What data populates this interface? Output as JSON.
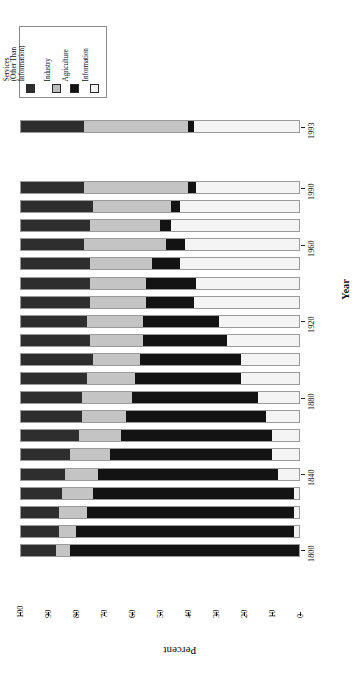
{
  "chart_data": {
    "type": "bar",
    "orientation": "horizontal-rotated-90",
    "stacked": true,
    "title": "",
    "xlabel": "Percent",
    "ylabel": "Year",
    "xlim": [
      0,
      100
    ],
    "x_tick_labels": [
      "100",
      "90",
      "80",
      "70",
      "60",
      "50",
      "40",
      "30",
      "20",
      "10",
      "0"
    ],
    "x_axis_direction": "descending-left-to-right",
    "grid": false,
    "legend_position": "top-left",
    "categories": [
      "1993",
      "1990",
      "1980",
      "1970",
      "1960",
      "1950",
      "1940",
      "1930",
      "1920",
      "1910",
      "1900",
      "1890",
      "1880",
      "1870",
      "1860",
      "1850",
      "1840",
      "1830",
      "1820",
      "1810",
      "1800"
    ],
    "y_tick_labels": [
      "1993",
      "1990",
      "1960",
      "1920",
      "1880",
      "1840",
      "1800"
    ],
    "series": [
      {
        "name": "Services (Other Than Information)",
        "key": "services",
        "color": "#2e2e2e",
        "values": [
          23,
          23,
          26,
          25,
          23,
          25,
          25,
          25,
          24,
          25,
          26,
          24,
          22,
          22,
          21,
          18,
          16,
          15,
          14,
          14,
          13
        ]
      },
      {
        "name": "Industry",
        "key": "industry",
        "color": "#c4c4c4",
        "values": [
          37,
          37,
          28,
          25,
          29,
          22,
          20,
          20,
          20,
          19,
          17,
          17,
          18,
          16,
          15,
          14,
          12,
          11,
          10,
          6,
          5
        ]
      },
      {
        "name": "Agriculture",
        "key": "agriculture",
        "color": "#131313",
        "values": [
          2,
          3,
          3,
          4,
          7,
          10,
          18,
          17,
          27,
          30,
          36,
          38,
          45,
          50,
          54,
          58,
          64,
          72,
          74,
          78,
          82
        ]
      },
      {
        "name": "Information",
        "key": "information",
        "color": "#f4f4f4",
        "values": [
          38,
          37,
          43,
          46,
          41,
          43,
          37,
          38,
          29,
          26,
          21,
          21,
          15,
          12,
          10,
          10,
          8,
          2,
          2,
          2,
          0
        ]
      }
    ]
  },
  "legend": {
    "entries": [
      {
        "label": "Services\n(Other Than\nInformation)",
        "swatch": "services-swatch"
      },
      {
        "label": "Industry",
        "swatch": "industry-swatch"
      },
      {
        "label": "Agriculture",
        "swatch": "agriculture-swatch"
      },
      {
        "label": "Information",
        "swatch": "information-swatch"
      }
    ]
  },
  "axes": {
    "year_title": "Year",
    "percent_title": "Percent"
  }
}
